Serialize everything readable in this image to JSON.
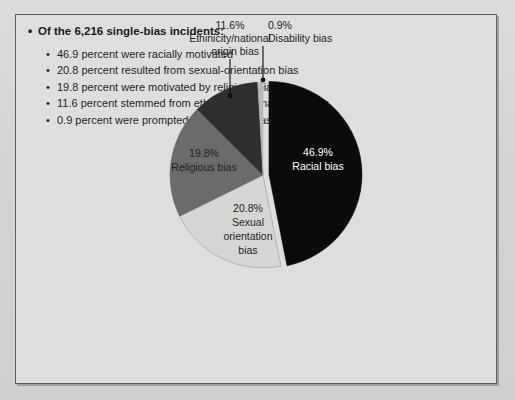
{
  "panel": {
    "heading": {
      "bullet": "•",
      "text": "Of the 6,216 single-bias incidents:"
    },
    "bullet_char": "•",
    "items": [
      "46.9 percent were racially motivated",
      "20.8 percent resulted from sexual-orientation bias",
      "19.8 percent were motivated by religious bias",
      "11.6 percent stemmed from ethnicity/national origin bias",
      "0.9 percent were prompted by disability bias"
    ]
  },
  "chart_data": {
    "type": "pie",
    "title": "",
    "legend_position": "callout-labels",
    "categories": [
      "Racial bias",
      "Sexual orientation bias",
      "Religious bias",
      "Ethinicity/national origin bias",
      "Disability bias"
    ],
    "values": [
      46.9,
      20.8,
      19.8,
      11.6,
      0.9
    ],
    "units": "percent",
    "total_label": "6,216 single-bias incidents",
    "total": 6216,
    "colors": [
      "#0b0b0b",
      "#d5d5d3",
      "#6b6b6b",
      "#2f2f2f",
      "#b9b9b7"
    ],
    "exploded_slice": "Racial bias",
    "slices": [
      {
        "name": "Racial bias",
        "value": 46.9,
        "percent_label": "46.9%",
        "name_lines": [
          "Racial bias"
        ],
        "color": "#0b0b0b",
        "label_color": "#ffffff",
        "label_style": "inside"
      },
      {
        "name": "Sexual orientation bias",
        "value": 20.8,
        "percent_label": "20.8%",
        "name_lines": [
          "Sexual",
          "orientation",
          "bias"
        ],
        "color": "#d5d5d3",
        "label_color": "#1f1f1f",
        "label_style": "inside"
      },
      {
        "name": "Religious bias",
        "value": 19.8,
        "percent_label": "19.8%",
        "name_lines": [
          "Religious bias"
        ],
        "color": "#6b6b6b",
        "label_color": "#1f1f1f",
        "label_style": "inside"
      },
      {
        "name": "Ethinicity/national origin bias",
        "value": 11.6,
        "percent_label": "11.6%",
        "name_lines": [
          "Ethinicity/national",
          "origin bias"
        ],
        "color": "#2f2f2f",
        "label_color": "#1f1f1f",
        "label_style": "callout"
      },
      {
        "name": "Disability bias",
        "value": 0.9,
        "percent_label": "0.9%",
        "name_lines": [
          "Disability bias"
        ],
        "color": "#b9b9b7",
        "label_color": "#1f1f1f",
        "label_style": "callout"
      }
    ]
  },
  "labels": {
    "racial_pct": "46.9%",
    "racial_name": "Racial bias",
    "sexual_pct": "20.8%",
    "sexual_l1": "Sexual",
    "sexual_l2": "orientation",
    "sexual_l3": "bias",
    "religious_pct": "19.8%",
    "religious_name": "Religious bias",
    "ethnicity_pct": "11.6%",
    "ethnicity_l1": "Ethinicity/national",
    "ethnicity_l2": "origin bias",
    "disability_pct": "0.9%",
    "disability_name": "Disability bias"
  }
}
